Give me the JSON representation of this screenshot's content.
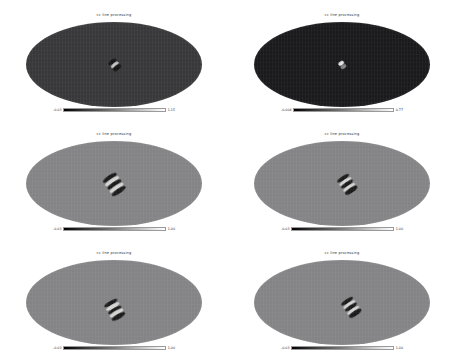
{
  "figure": {
    "background_color": "#ffffff",
    "rows": 3,
    "columns": 2,
    "projection": "mollweide"
  },
  "chart_data": {
    "type": "heatmap",
    "title": "",
    "subtitle": "",
    "xlabel": "",
    "ylabel": "",
    "projection": "mollweide",
    "colormap": "grayscale",
    "grid": true,
    "legend_position": "below-each-panel",
    "panels": [
      {
        "id": "panel-top-left",
        "row": 0,
        "col": 0,
        "title": "cc line processing",
        "background_level": "#38383a",
        "cbar_min": "-0.03",
        "cbar_max": "1.15",
        "cbar_ticks": [
          "-0.03",
          "1.15"
        ],
        "feature": {
          "shape": "compact-dipole",
          "center_x_pct": 50,
          "center_y_pct": 50,
          "angle_deg": -38,
          "width_px": 11,
          "height_px": 11,
          "contrast": "high"
        }
      },
      {
        "id": "panel-top-right",
        "row": 0,
        "col": 1,
        "title": "cc line processing",
        "background_level": "#1a1a1c",
        "cbar_min": "-0.004",
        "cbar_max": "0.77",
        "cbar_ticks": [
          "-0.004",
          "0.77"
        ],
        "feature": {
          "shape": "small-bright-spot",
          "center_x_pct": 50,
          "center_y_pct": 50,
          "angle_deg": -35,
          "width_px": 8,
          "height_px": 7,
          "contrast": "bright"
        }
      },
      {
        "id": "panel-middle-left",
        "row": 1,
        "col": 0,
        "title": "cc line processing",
        "background_level": "#848486",
        "cbar_min": "-0.03",
        "cbar_max": "1.00",
        "cbar_ticks": [
          "-0.03",
          "1.00"
        ],
        "feature": {
          "shape": "striped-quadrupole",
          "center_x_pct": 50,
          "center_y_pct": 50,
          "angle_deg": -34,
          "width_px": 18,
          "height_px": 20,
          "contrast": "medium"
        }
      },
      {
        "id": "panel-middle-right",
        "row": 1,
        "col": 1,
        "title": "cc line processing",
        "background_level": "#848486",
        "cbar_min": "-0.03",
        "cbar_max": "1.00",
        "cbar_ticks": [
          "-0.03",
          "1.00"
        ],
        "feature": {
          "shape": "striped-quadrupole",
          "center_x_pct": 53,
          "center_y_pct": 50,
          "angle_deg": -34,
          "width_px": 16,
          "height_px": 18,
          "contrast": "medium"
        }
      },
      {
        "id": "panel-bottom-left",
        "row": 2,
        "col": 0,
        "title": "cc line processing",
        "background_level": "#848486",
        "cbar_min": "-0.03",
        "cbar_max": "1.00",
        "cbar_ticks": [
          "-0.03",
          "1.00"
        ],
        "feature": {
          "shape": "striped-quadrupole",
          "center_x_pct": 50,
          "center_y_pct": 58,
          "angle_deg": -30,
          "width_px": 17,
          "height_px": 19,
          "contrast": "medium"
        }
      },
      {
        "id": "panel-bottom-right",
        "row": 2,
        "col": 1,
        "title": "cc line processing",
        "background_level": "#848486",
        "cbar_min": "-0.03",
        "cbar_max": "1.00",
        "cbar_ticks": [
          "-0.03",
          "1.00"
        ],
        "feature": {
          "shape": "striped-quadrupole",
          "center_x_pct": 55,
          "center_y_pct": 55,
          "angle_deg": -34,
          "width_px": 16,
          "height_px": 18,
          "contrast": "medium"
        }
      }
    ]
  }
}
